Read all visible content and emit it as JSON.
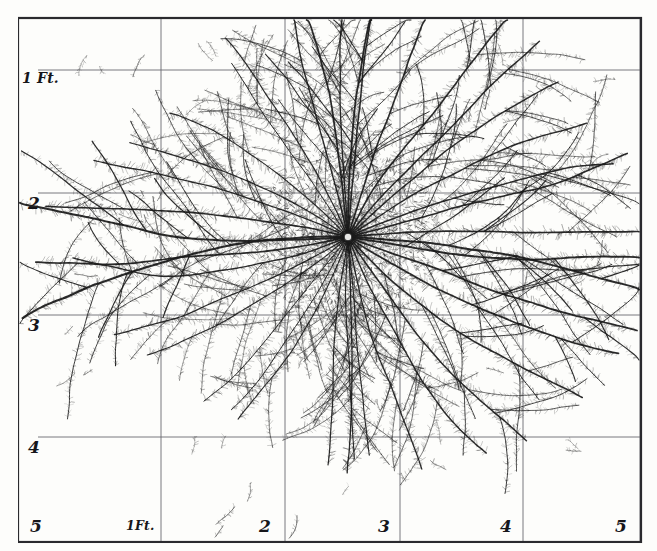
{
  "figure": {
    "type": "scientific-illustration",
    "orientation": "horizontal-and-vertical-grid",
    "background_color": "#fdfdfb",
    "ink_color": "#1a1a1a",
    "frame_color": "#2a2a2e",
    "grid_color": "#6a6a70"
  },
  "frame": {
    "left": 18,
    "top": 18,
    "right": 641,
    "bottom": 542,
    "stroke_width": 2.2
  },
  "grid": {
    "vertical_x": [
      161,
      285,
      400,
      523,
      640
    ],
    "horizontal_y": [
      70,
      193,
      315,
      437
    ],
    "stroke_width": 0.9
  },
  "axes": {
    "y_axis": {
      "unit": "Ft.",
      "ticks": [
        {
          "label": "1 Ft.",
          "y": 70,
          "x": 22,
          "kind": "ft"
        },
        {
          "label": "2",
          "y": 193,
          "x": 28,
          "kind": "num"
        },
        {
          "label": "3",
          "y": 315,
          "x": 28,
          "kind": "num"
        },
        {
          "label": "4",
          "y": 437,
          "x": 28,
          "kind": "num"
        }
      ]
    },
    "x_axis": {
      "unit": "Ft.",
      "ticks": [
        {
          "label": "5",
          "x": 30,
          "y": 516,
          "kind": "num"
        },
        {
          "label": "1Ft.",
          "x": 126,
          "y": 518,
          "kind": "ftx"
        },
        {
          "label": "2",
          "x": 259,
          "y": 516,
          "kind": "num"
        },
        {
          "label": "3",
          "x": 378,
          "y": 516,
          "kind": "num"
        },
        {
          "label": "4",
          "x": 500,
          "y": 516,
          "kind": "num"
        },
        {
          "label": "5",
          "x": 615,
          "y": 516,
          "kind": "num"
        }
      ]
    }
  },
  "chart_data": {
    "type": "scatter",
    "title": "",
    "xlabel": "Feet",
    "ylabel": "Feet",
    "grid": true,
    "legend": null,
    "xlim": [
      0,
      5.5
    ],
    "ylim": [
      0,
      4.5
    ],
    "crown": {
      "x": 348,
      "y": 237,
      "radius": 7
    },
    "roots": [
      {
        "angle": 182,
        "length": 335,
        "weight": 2.1,
        "curve": -14,
        "depth": 4
      },
      {
        "angle": 176,
        "length": 330,
        "weight": 2.0,
        "curve": 10,
        "depth": 4
      },
      {
        "angle": 195,
        "length": 300,
        "weight": 1.6,
        "curve": -22,
        "depth": 4
      },
      {
        "angle": 168,
        "length": 310,
        "weight": 1.7,
        "curve": 18,
        "depth": 4
      },
      {
        "angle": 205,
        "length": 262,
        "weight": 1.3,
        "curve": -18,
        "depth": 3
      },
      {
        "angle": 158,
        "length": 278,
        "weight": 1.4,
        "curve": 20,
        "depth": 4
      },
      {
        "angle": 215,
        "length": 235,
        "weight": 1.2,
        "curve": -24,
        "depth": 3
      },
      {
        "angle": 148,
        "length": 250,
        "weight": 1.2,
        "curve": 22,
        "depth": 3
      },
      {
        "angle": 226,
        "length": 215,
        "weight": 1.1,
        "curve": -20,
        "depth": 3
      },
      {
        "angle": 138,
        "length": 230,
        "weight": 1.1,
        "curve": 18,
        "depth": 3
      },
      {
        "angle": 237,
        "length": 205,
        "weight": 1.0,
        "curve": -16,
        "depth": 3
      },
      {
        "angle": 128,
        "length": 215,
        "weight": 1.0,
        "curve": 16,
        "depth": 3
      },
      {
        "angle": 247,
        "length": 230,
        "weight": 1.2,
        "curve": -10,
        "depth": 3
      },
      {
        "angle": 118,
        "length": 205,
        "weight": 1.0,
        "curve": 12,
        "depth": 3
      },
      {
        "angle": 257,
        "length": 255,
        "weight": 1.4,
        "curve": -6,
        "depth": 4
      },
      {
        "angle": 108,
        "length": 210,
        "weight": 1.1,
        "curve": 10,
        "depth": 3
      },
      {
        "angle": 266,
        "length": 230,
        "weight": 1.3,
        "curve": 6,
        "depth": 3
      },
      {
        "angle": 98,
        "length": 225,
        "weight": 1.2,
        "curve": 6,
        "depth": 3
      },
      {
        "angle": 276,
        "length": 248,
        "weight": 1.5,
        "curve": 12,
        "depth": 4
      },
      {
        "angle": 88,
        "length": 232,
        "weight": 1.3,
        "curve": -6,
        "depth": 3
      },
      {
        "angle": 286,
        "length": 270,
        "weight": 1.6,
        "curve": 16,
        "depth": 4
      },
      {
        "angle": 78,
        "length": 240,
        "weight": 1.3,
        "curve": -10,
        "depth": 3
      },
      {
        "angle": 296,
        "length": 280,
        "weight": 1.6,
        "curve": 18,
        "depth": 4
      },
      {
        "angle": 68,
        "length": 255,
        "weight": 1.4,
        "curve": -14,
        "depth": 4
      },
      {
        "angle": 306,
        "length": 270,
        "weight": 1.5,
        "curve": 20,
        "depth": 4
      },
      {
        "angle": 58,
        "length": 268,
        "weight": 1.5,
        "curve": -18,
        "depth": 4
      },
      {
        "angle": 316,
        "length": 258,
        "weight": 1.4,
        "curve": 18,
        "depth": 4
      },
      {
        "angle": 46,
        "length": 282,
        "weight": 1.6,
        "curve": -20,
        "depth": 4
      },
      {
        "angle": 326,
        "length": 262,
        "weight": 1.4,
        "curve": 16,
        "depth": 4
      },
      {
        "angle": 34,
        "length": 292,
        "weight": 1.7,
        "curve": -18,
        "depth": 4
      },
      {
        "angle": 336,
        "length": 272,
        "weight": 1.5,
        "curve": 14,
        "depth": 4
      },
      {
        "angle": 22,
        "length": 300,
        "weight": 1.8,
        "curve": -12,
        "depth": 4
      },
      {
        "angle": 346,
        "length": 288,
        "weight": 1.6,
        "curve": 10,
        "depth": 4
      },
      {
        "angle": 10,
        "length": 312,
        "weight": 1.9,
        "curve": -8,
        "depth": 4
      },
      {
        "angle": 2,
        "length": 320,
        "weight": 2.0,
        "curve": 6,
        "depth": 4
      },
      {
        "angle": 354,
        "length": 300,
        "weight": 1.7,
        "curve": 6,
        "depth": 4
      },
      {
        "angle": 262,
        "length": 300,
        "weight": 1.7,
        "curve": -4,
        "depth": 4
      },
      {
        "angle": 271,
        "length": 305,
        "weight": 1.8,
        "curve": 8,
        "depth": 4
      },
      {
        "angle": 84,
        "length": 215,
        "weight": 1.1,
        "curve": 4,
        "depth": 3
      },
      {
        "angle": 93,
        "length": 218,
        "weight": 1.1,
        "curve": -4,
        "depth": 3
      }
    ]
  }
}
